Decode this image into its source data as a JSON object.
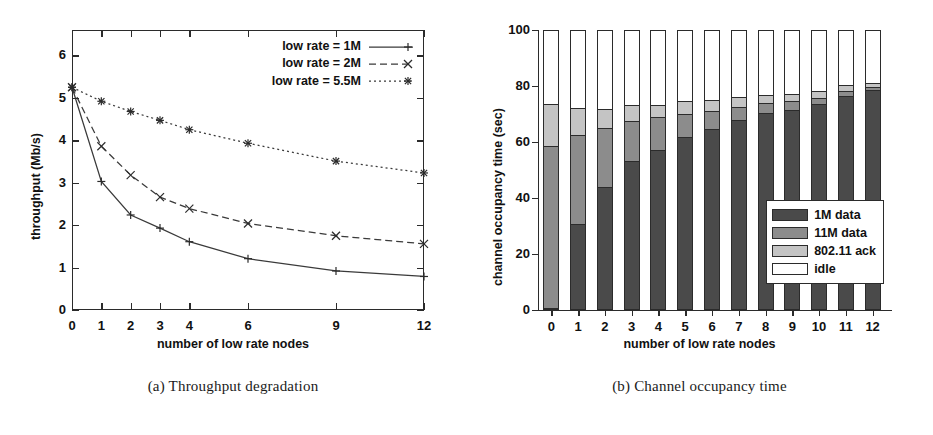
{
  "figure": {
    "panels": [
      {
        "caption": "(a) Throughput degradation"
      },
      {
        "caption": "(b) Channel occupancy time"
      }
    ]
  },
  "chart_data": [
    {
      "type": "line",
      "title": "",
      "subtitle": "",
      "caption": "(a) Throughput degradation",
      "xlabel": "number of low rate nodes",
      "ylabel": "throughput (Mb/s)",
      "x": [
        0,
        1,
        2,
        3,
        4,
        6,
        9,
        12
      ],
      "xticklabels": [
        "0",
        "1",
        "2",
        "3",
        "4",
        "6",
        "9",
        "12"
      ],
      "xlim": [
        0,
        12
      ],
      "ylim": [
        0,
        6.6
      ],
      "yticks": [
        0,
        1,
        2,
        3,
        4,
        5,
        6
      ],
      "yticklabels": [
        "0",
        "1",
        "2",
        "3",
        "4",
        "5",
        "6"
      ],
      "grid": false,
      "legend_position": "top-right",
      "series": [
        {
          "name": "low rate = 1M",
          "marker": "plus",
          "linestyle": "solid",
          "color": "#3a3a3a",
          "values": [
            5.25,
            3.03,
            2.24,
            1.93,
            1.61,
            1.21,
            0.92,
            0.79
          ]
        },
        {
          "name": "low rate = 2M",
          "marker": "cross",
          "linestyle": "dashed",
          "color": "#3a3a3a",
          "values": [
            5.25,
            3.86,
            3.18,
            2.66,
            2.39,
            2.04,
            1.75,
            1.56
          ]
        },
        {
          "name": "low rate = 5.5M",
          "marker": "star",
          "linestyle": "dotted",
          "color": "#3a3a3a",
          "values": [
            5.25,
            4.92,
            4.68,
            4.47,
            4.25,
            3.93,
            3.51,
            3.23
          ]
        }
      ]
    },
    {
      "type": "bar",
      "stacked": true,
      "title": "",
      "caption": "(b) Channel occupancy time",
      "xlabel": "number of low rate nodes",
      "ylabel": "channel occupancy time (sec)",
      "categories": [
        "0",
        "1",
        "2",
        "3",
        "4",
        "5",
        "6",
        "7",
        "8",
        "9",
        "10",
        "11",
        "12"
      ],
      "xlim": [
        -0.5,
        12.5
      ],
      "ylim": [
        0,
        100
      ],
      "yticks": [
        0,
        20,
        40,
        60,
        80,
        100
      ],
      "yticklabels": [
        "0",
        "20",
        "40",
        "60",
        "80",
        "100"
      ],
      "grid": false,
      "legend_position": "inside-lower-right",
      "series": [
        {
          "name": "1M data",
          "color": "#4a4a4a",
          "values": [
            0,
            30.3,
            43.4,
            52.9,
            57.0,
            61.4,
            64.4,
            67.6,
            70.0,
            71.4,
            73.5,
            76.4,
            78.4
          ]
        },
        {
          "name": "11M data",
          "color": "#8c8c8c",
          "values": [
            58.2,
            31.9,
            21.4,
            14.4,
            11.7,
            8.3,
            6.5,
            4.8,
            3.6,
            2.9,
            2.2,
            1.7,
            1.2
          ]
        },
        {
          "name": "802.11 ack",
          "color": "#c4c4c4",
          "values": [
            15.3,
            9.6,
            6.8,
            5.6,
            4.4,
            4.7,
            4.0,
            3.5,
            3.1,
            2.8,
            2.4,
            2.0,
            1.5
          ]
        },
        {
          "name": "idle",
          "color": "#ffffff",
          "values": [
            26.5,
            28.2,
            28.4,
            27.1,
            26.9,
            25.6,
            25.1,
            24.1,
            23.3,
            22.9,
            21.9,
            19.9,
            18.9
          ]
        }
      ]
    }
  ]
}
